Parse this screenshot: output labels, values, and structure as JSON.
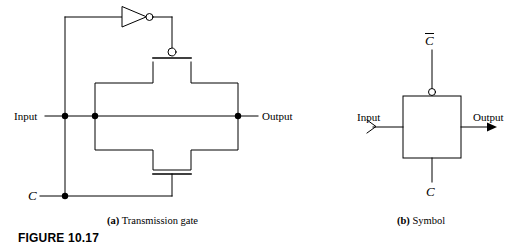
{
  "figure": {
    "id_label": "FIGURE 10.17",
    "id_x": 18,
    "id_y": 232
  },
  "panels": [
    {
      "key": "transmission_gate",
      "caption_tag": "(a)",
      "caption_text": "Transmission gate",
      "caption_x": 107,
      "caption_y": 216
    },
    {
      "key": "symbol",
      "caption_tag": "(b)",
      "caption_text": "Symbol",
      "caption_x": 397,
      "caption_y": 216
    }
  ],
  "panel_a": {
    "labels": {
      "input": "Input",
      "output": "Output",
      "control": "C"
    },
    "label_positions": {
      "input_x": 14,
      "input_y": 111,
      "output_x": 262,
      "output_y": 111,
      "control_x": 28,
      "control_y": 192
    },
    "components": {
      "inverter_name": "inverter",
      "pmos_name": "pmos-transistor",
      "nmos_name": "nmos-transistor"
    },
    "nodes": [
      {
        "name": "input-node",
        "x": 65,
        "y": 116
      },
      {
        "name": "input-branch-node",
        "x": 95,
        "y": 116
      },
      {
        "name": "output-node",
        "x": 238,
        "y": 116
      },
      {
        "name": "control-node",
        "x": 65,
        "y": 196
      }
    ]
  },
  "panel_b": {
    "labels": {
      "input": "Input",
      "output": "Output",
      "control_top": "C",
      "control_top_overbar": true,
      "control_bottom": "C"
    },
    "label_positions": {
      "input_x": 357,
      "input_y": 112,
      "output_x": 473,
      "output_y": 112,
      "control_top_x": 424,
      "control_top_y": 36,
      "control_bottom_x": 424,
      "control_bottom_y": 187
    },
    "box": {
      "x": 403,
      "y": 96,
      "w": 58,
      "h": 62
    },
    "bubble": {
      "cx": 432,
      "cy": 92,
      "r": 3.5
    }
  },
  "style": {
    "stroke": "#000000",
    "background": "#ffffff",
    "line_width": 1
  }
}
